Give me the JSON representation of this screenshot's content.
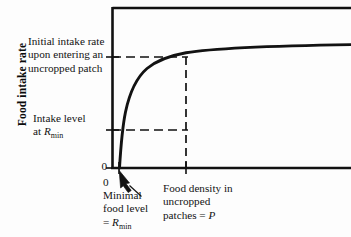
{
  "figure": {
    "background_color": "#fdfdfd",
    "line_color": "#111111",
    "axis_title_y": "Food intake rate",
    "tick_zero_y": "0",
    "tick_zero_x": "0"
  },
  "annotations": {
    "initial_rate": "Initial intake rate\nupon entering an\nuncropped patch",
    "intake_level_line1": "Intake level",
    "intake_level_line2_prefix": "at ",
    "intake_level_symbol": "R",
    "intake_level_subscript": "min",
    "minimal_line1": "Minimal",
    "minimal_line2": "food level",
    "minimal_line3_prefix": "= ",
    "minimal_symbol": "R",
    "minimal_subscript": "min",
    "density_line1": "Food density in",
    "density_line2": "uncropped",
    "density_line3_prefix": "patches = ",
    "density_symbol": "P"
  },
  "chart_data": {
    "type": "line",
    "title": "",
    "xlabel": "Food density in uncropped patches = P",
    "ylabel": "Food intake rate",
    "grid": false,
    "legend": "none",
    "axis_origin_label": "0",
    "xlim": [
      0,
      1
    ],
    "ylim": [
      0,
      1
    ],
    "curve_description": "Saturating (asymptotic) functional response: intake rate rises steeply from zero at the minimal food level R_min and plateaus at the initial intake rate upon entering an uncropped patch.",
    "reference_lines": [
      {
        "name": "initial-intake-rate",
        "orientation": "horizontal",
        "style": "dashed",
        "y_value": 0.86,
        "label": "Initial intake rate upon entering an uncropped patch"
      },
      {
        "name": "intake-level-at-rmin",
        "orientation": "horizontal",
        "style": "dashed",
        "y_value": 0.28,
        "label": "Intake level at R_min"
      },
      {
        "name": "food-density-P",
        "orientation": "vertical",
        "style": "dashed",
        "x_value": 0.36,
        "label": "Food density in uncropped patches = P"
      }
    ],
    "x": [
      0.032,
      0.04,
      0.05,
      0.062,
      0.078,
      0.098,
      0.122,
      0.15,
      0.185,
      0.225,
      0.27,
      0.315,
      0.36,
      0.42,
      0.5,
      0.6,
      0.72,
      0.86,
      1.0
    ],
    "values": [
      0.0,
      0.12,
      0.24,
      0.35,
      0.45,
      0.54,
      0.62,
      0.69,
      0.745,
      0.785,
      0.815,
      0.84,
      0.86,
      0.88,
      0.898,
      0.912,
      0.922,
      0.93,
      0.935
    ],
    "markers": [
      {
        "name": "minimal-food-level",
        "x": 0.032,
        "y": 0.0,
        "label": "Minimal food level = R_min"
      }
    ]
  }
}
